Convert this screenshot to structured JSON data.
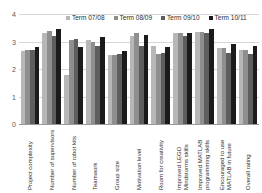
{
  "chart_data": {
    "type": "bar",
    "title": "",
    "xlabel": "",
    "ylabel": "",
    "ylim": [
      0,
      4
    ],
    "yticks": [
      "0",
      "1",
      "2",
      "3",
      "4"
    ],
    "grid": true,
    "legend_position": "top-center",
    "categories": [
      "Project complexity",
      "Number of supervisors",
      "Number of robot kits",
      "Teamwork",
      "Group size",
      "Motivation level",
      "Room for creativity",
      "Improved LEGO Mindstorms skills",
      "Improved MATLAB programming skills",
      "Encouraged to use MATLAB in future",
      "Overall rating"
    ],
    "series": [
      {
        "name": "Term 07/08",
        "color": "#b7b7b7",
        "values": [
          2.65,
          3.3,
          1.8,
          3.05,
          2.5,
          3.2,
          2.85,
          3.3,
          3.35,
          2.75,
          2.7
        ]
      },
      {
        "name": "Term 08/09",
        "color": "#8f8f8f",
        "values": [
          2.7,
          3.4,
          3.05,
          3.0,
          2.5,
          3.3,
          2.55,
          3.3,
          3.35,
          2.75,
          2.7
        ]
      },
      {
        "name": "Term 09/10",
        "color": "#5e5e5e",
        "values": [
          2.7,
          3.2,
          3.1,
          2.85,
          2.55,
          2.85,
          2.6,
          3.2,
          3.3,
          2.6,
          2.55
        ]
      },
      {
        "name": "Term 10/11",
        "color": "#1b1b1b",
        "values": [
          2.8,
          3.45,
          2.8,
          3.15,
          2.65,
          3.25,
          2.8,
          3.3,
          3.45,
          2.9,
          2.85
        ]
      }
    ]
  }
}
